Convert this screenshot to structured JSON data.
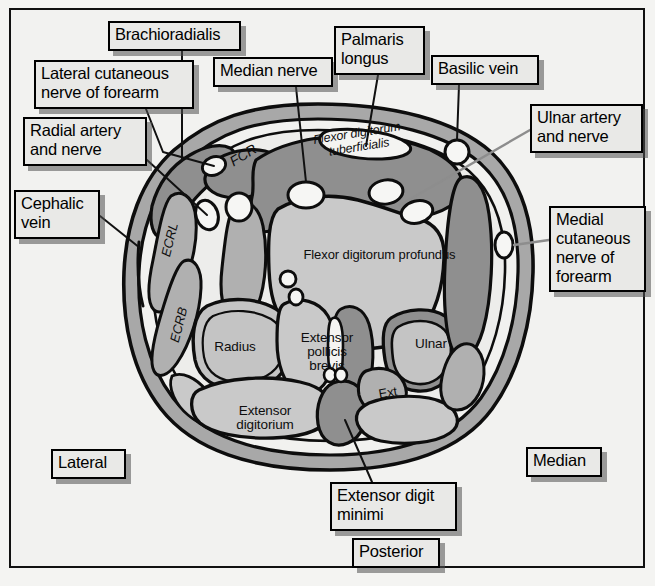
{
  "figure": {
    "orientation_labels": [
      "Lateral",
      "Median",
      "Posterior"
    ],
    "colors": {
      "page_background": "#f2f2f0",
      "frame_border": "#111111",
      "label_fill": "#e9e9e7",
      "label_border": "#000000",
      "skin_band": "#a8a8a8",
      "muscle_light": "#c9c9c9",
      "muscle_mid": "#b0b0b0",
      "muscle_dark": "#8f8f8f",
      "bone_fill": "#c4c4c4",
      "vessel_fill": "#f6f6f4",
      "outline": "#0d0d0d",
      "leader_line": "#111111"
    }
  },
  "callouts": [
    {
      "id": "brachioradialis",
      "text": "Brachioradialis",
      "x": 108,
      "y": 21,
      "w": 133,
      "h": 30
    },
    {
      "id": "lateral-cutaneous",
      "text": "Lateral cutaneous\nnerve of forearm",
      "x": 34,
      "y": 60,
      "w": 160,
      "h": 49
    },
    {
      "id": "median-nerve",
      "text": "Median nerve",
      "x": 213,
      "y": 57,
      "w": 120,
      "h": 30
    },
    {
      "id": "palmaris-longus",
      "text": "Palmaris\nlongus",
      "x": 334,
      "y": 26,
      "w": 91,
      "h": 49
    },
    {
      "id": "basilic-vein",
      "text": "Basilic vein",
      "x": 431,
      "y": 55,
      "w": 108,
      "h": 30
    },
    {
      "id": "radial-artery",
      "text": "Radial artery\nand nerve",
      "x": 23,
      "y": 117,
      "w": 124,
      "h": 49
    },
    {
      "id": "ulnar-artery",
      "text": "Ulnar artery\nand nerve",
      "x": 530,
      "y": 104,
      "w": 113,
      "h": 49
    },
    {
      "id": "cephalic-vein",
      "text": "Cephalic\nvein",
      "x": 14,
      "y": 190,
      "w": 86,
      "h": 49
    },
    {
      "id": "medial-cutaneous",
      "text": "Medial\ncutaneous\nnerve of\nforearm",
      "x": 549,
      "y": 206,
      "w": 97,
      "h": 86
    },
    {
      "id": "lateral",
      "text": "Lateral",
      "x": 51,
      "y": 449,
      "w": 75,
      "h": 30
    },
    {
      "id": "median",
      "text": "Median",
      "x": 526,
      "y": 447,
      "w": 76,
      "h": 30
    },
    {
      "id": "extensor-digit-minimi",
      "text": "Extensor digit\nminimi",
      "x": 330,
      "y": 482,
      "w": 127,
      "h": 49
    },
    {
      "id": "posterior",
      "text": "Posterior",
      "x": 352,
      "y": 538,
      "w": 88,
      "h": 30
    }
  ],
  "internal_labels": [
    {
      "id": "fcr",
      "text": "FCR",
      "x": 221,
      "y": 148,
      "w": 44,
      "rotate": -32,
      "style": "italic",
      "size": 14
    },
    {
      "id": "fds",
      "text": "Flexor digitorum\ntuberficialis",
      "x": 302,
      "y": 126,
      "w": 112,
      "rotate": -9,
      "style": "italic",
      "size": 12.5
    },
    {
      "id": "fdp",
      "text": "Flexor digitorum profundus",
      "x": 297,
      "y": 248,
      "w": 165,
      "rotate": 0,
      "style": "plain",
      "size": 13
    },
    {
      "id": "ecrl",
      "text": "ECRL",
      "x": 148,
      "y": 233,
      "w": 44,
      "rotate": -76,
      "style": "italic",
      "size": 13
    },
    {
      "id": "ecrb",
      "text": "ECRB",
      "x": 156,
      "y": 318,
      "w": 46,
      "rotate": -76,
      "style": "italic",
      "size": 13
    },
    {
      "id": "radius",
      "text": "Radius",
      "x": 209,
      "y": 340,
      "w": 52,
      "rotate": 0,
      "style": "plain",
      "size": 13.5
    },
    {
      "id": "epb",
      "text": "Extensor\npollicis\nbrevis",
      "x": 296,
      "y": 331,
      "w": 62,
      "rotate": 0,
      "style": "plain",
      "size": 13.5
    },
    {
      "id": "ulnar",
      "text": "Ulnar",
      "x": 409,
      "y": 337,
      "w": 44,
      "rotate": 0,
      "style": "plain",
      "size": 13.5
    },
    {
      "id": "ext",
      "text": "Ext",
      "x": 374,
      "y": 386,
      "w": 28,
      "rotate": -10,
      "style": "plain",
      "size": 13
    },
    {
      "id": "ed",
      "text": "Extensor\ndigitorium",
      "x": 228,
      "y": 404,
      "w": 74,
      "rotate": 0,
      "style": "plain",
      "size": 13.5
    }
  ]
}
